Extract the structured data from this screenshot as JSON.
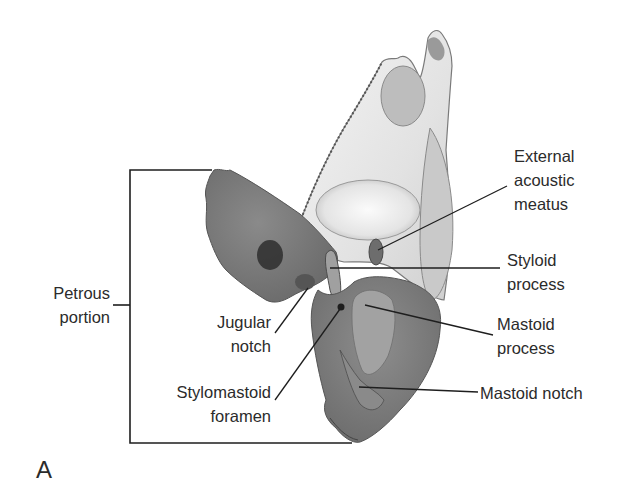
{
  "figure": {
    "panel_label": "A",
    "colors": {
      "background": "#ffffff",
      "text": "#2b2b2b",
      "leader_line": "#1e1e1e",
      "bone_dark": "#6f6f6f",
      "bone_mid": "#8c8c8c",
      "bone_light": "#e6e6e6"
    }
  },
  "labels": {
    "external_acoustic_meatus": {
      "lines": [
        "External",
        "acoustic",
        "meatus"
      ]
    },
    "styloid_process": {
      "lines": [
        "Styloid",
        "process"
      ]
    },
    "mastoid_process": {
      "lines": [
        "Mastoid",
        "process"
      ]
    },
    "mastoid_notch": {
      "lines": [
        "Mastoid notch"
      ]
    },
    "petrous_portion": {
      "lines": [
        "Petrous",
        "portion"
      ]
    },
    "jugular_notch": {
      "lines": [
        "Jugular",
        "notch"
      ]
    },
    "stylomastoid_foramen": {
      "lines": [
        "Stylomastoid",
        "foramen"
      ]
    }
  }
}
